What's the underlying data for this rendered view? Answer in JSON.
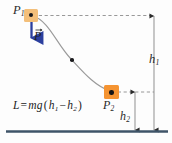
{
  "diagram": {
    "background_color": "#fdfdfd",
    "labels": {
      "point_start": "P",
      "point_start_sub": "1",
      "point_end": "P",
      "point_end_sub": "2",
      "height_total": "h",
      "height_total_sub": "1",
      "height_lower": "h",
      "height_lower_sub": "2",
      "force_vector": "P"
    },
    "formula": {
      "lhs": "L",
      "equals": "=",
      "mass_gravity": "mg",
      "open_paren": "(",
      "term1": "h",
      "term1_sub": "1",
      "minus": "−",
      "term2": "h",
      "term2_sub": "2",
      "close_paren": ")",
      "full_text": "L = mg(h₁ − h₂)"
    },
    "colors": {
      "marker_start": "#f3bf7a",
      "marker_end": "#f59432",
      "force_arrow": "#2b3f9e",
      "path_curve": "#9a9a9a",
      "ground": "#3f5468",
      "dashed_guide": "#8d8d8d",
      "dimension_line": "#8a8a8a",
      "label_text": "#2a2a2a"
    },
    "elements": {
      "ground_label": "ground-line",
      "curve_label": "trajectory-path",
      "force_arrow_label": "weight-force-arrow",
      "guide_top_label": "dashed-guide-top",
      "guide_bottom_label": "dashed-guide-bottom",
      "dim_h1_label": "dimension-line-h1",
      "dim_h2_label": "dimension-line-h2"
    }
  }
}
